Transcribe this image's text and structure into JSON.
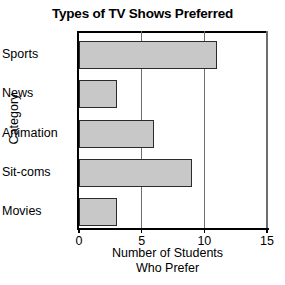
{
  "chart_data": {
    "type": "bar",
    "orientation": "horizontal",
    "title": "Types of TV Shows Preferred",
    "xlabel_line1": "Number of Students",
    "xlabel_line2": "Who Prefer",
    "ylabel": "Category",
    "categories": [
      "Sports",
      "News",
      "Animation",
      "Sit-coms",
      "Movies"
    ],
    "values": [
      11,
      3,
      6,
      9,
      3
    ],
    "xlim": [
      0,
      15
    ],
    "xticks": [
      0,
      5,
      10,
      15
    ],
    "xtick_labels": [
      "0",
      "5",
      "10",
      "15"
    ],
    "gridlines": [
      5,
      10,
      15
    ],
    "grid": true,
    "legend": null,
    "bar_fill_color": "#c8c8c8",
    "bar_edge_color": "#2b2b2b",
    "axis_color": "#000000",
    "grid_color": "#6e6e6e",
    "background_color": "#ffffff"
  }
}
